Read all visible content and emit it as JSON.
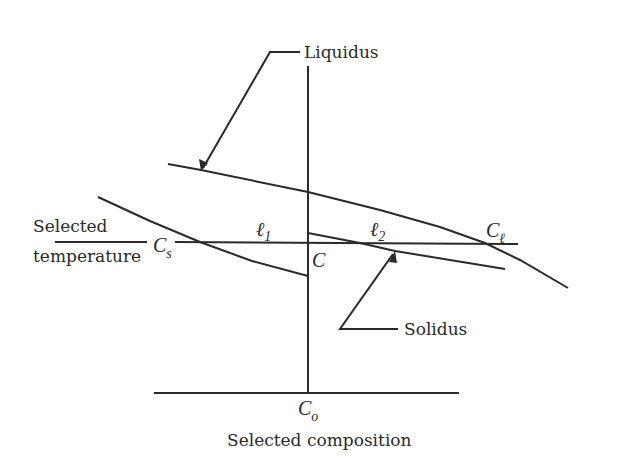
{
  "diagram": {
    "type": "phase-diagram-lever-rule",
    "labels": {
      "liquidus": "Liquidus",
      "solidus": "Solidus",
      "selected_temperature_line1": "Selected",
      "selected_temperature_line2": "temperature",
      "selected_composition": "Selected composition",
      "cs_main": "C",
      "cs_sub": "s",
      "cl_main": "C",
      "cl_sub": "ℓ",
      "c_point": "C",
      "c0_main": "C",
      "c0_sub": "o",
      "l1_main": "ℓ",
      "l1_sub": "1",
      "l2_main": "ℓ",
      "l2_sub": "2"
    },
    "colors": {
      "line": "#2a2a2a",
      "background": "#ffffff"
    }
  }
}
